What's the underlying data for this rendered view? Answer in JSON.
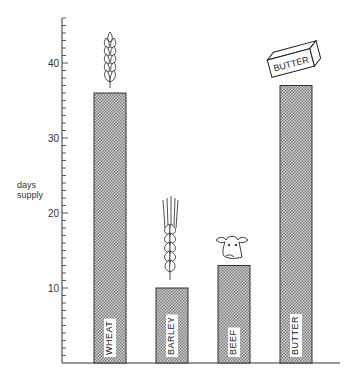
{
  "chart_data": {
    "type": "bar",
    "title": "",
    "xlabel": "",
    "ylabel": "days supply",
    "ylim": [
      0,
      46
    ],
    "yticks": [
      10,
      20,
      30,
      40
    ],
    "minor_tick_step": 1,
    "grid": false,
    "legend": null,
    "categories": [
      "WHEAT",
      "BARLEY",
      "BEEF",
      "BUTTER"
    ],
    "values": [
      36,
      10,
      13,
      37
    ],
    "pictograms": [
      "wheat-ear",
      "barley-ear",
      "cow-head",
      "butter-block"
    ],
    "annotations": [
      "BUTTER"
    ]
  },
  "colors": {
    "bar_fill": "#b8b8b8",
    "bar_stroke": "#333333",
    "axis": "#333333"
  },
  "ylabel_lines": [
    "days",
    "supply"
  ]
}
